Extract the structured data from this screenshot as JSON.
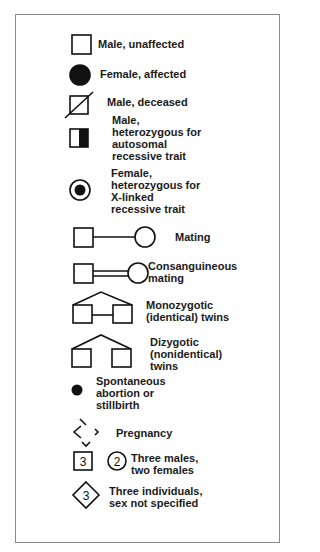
{
  "legend": {
    "items": [
      {
        "symbol": "open-square",
        "lines": [
          "Male, unaffected"
        ]
      },
      {
        "symbol": "filled-circle",
        "lines": [
          "Female, affected"
        ]
      },
      {
        "symbol": "slashed-square",
        "lines": [
          "Male, deceased"
        ]
      },
      {
        "symbol": "half-filled-square",
        "lines": [
          "Male,",
          "heterozygous for",
          "autosomal",
          "recessive trait"
        ]
      },
      {
        "symbol": "dotted-circle",
        "lines": [
          "Female,",
          "heterozygous for",
          "X-linked",
          "recessive trait"
        ]
      },
      {
        "symbol": "square-line-circle",
        "lines": [
          "Mating"
        ]
      },
      {
        "symbol": "square-double-line-circle",
        "lines": [
          "Consanguineous",
          "mating"
        ]
      },
      {
        "symbol": "monozygotic-twins",
        "lines": [
          "Monozygotic",
          "(identical) twins"
        ]
      },
      {
        "symbol": "dizygotic-twins",
        "lines": [
          "Dizygotic",
          "(nonidentical)",
          "twins"
        ]
      },
      {
        "symbol": "small-filled-dot",
        "lines": [
          "Spontaneous",
          "abortion or",
          "stillbirth"
        ]
      },
      {
        "symbol": "dashed-diamond",
        "lines": [
          "Pregnancy"
        ]
      },
      {
        "symbol": "numbered-square-and-circle",
        "square_number": "3",
        "circle_number": "2",
        "lines": [
          "Three males,",
          "two females"
        ]
      },
      {
        "symbol": "numbered-diamond",
        "diamond_number": "3",
        "lines": [
          "Three individuals,",
          "sex not specified"
        ]
      }
    ]
  },
  "colors": {
    "ink": "#111111",
    "frame": "#8c8c8c",
    "background": "#ffffff"
  }
}
